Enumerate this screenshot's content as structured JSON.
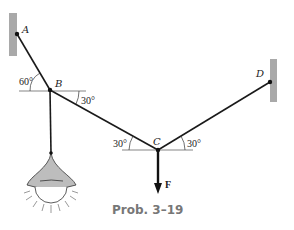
{
  "figure": {
    "caption": "Prob. 3–19",
    "points": {
      "A": {
        "label": "A",
        "x": 17,
        "y": 34
      },
      "B": {
        "label": "B",
        "x": 50,
        "y": 90
      },
      "C": {
        "label": "C",
        "x": 158,
        "y": 150
      },
      "D": {
        "label": "D",
        "x": 270,
        "y": 82
      }
    },
    "angles": {
      "AB_horizontal": "60°",
      "BC_horizontal": "30°",
      "CB_horizontal_at_C": "30°",
      "CD_horizontal_at_C": "30°"
    },
    "force": {
      "label": "F",
      "direction": "down"
    },
    "load": "hanging-lamp",
    "colors": {
      "line": "#1a1a1a",
      "wall": "#a9a9a9",
      "lampshade": "#bdbdbd",
      "caption": "#777777"
    }
  }
}
